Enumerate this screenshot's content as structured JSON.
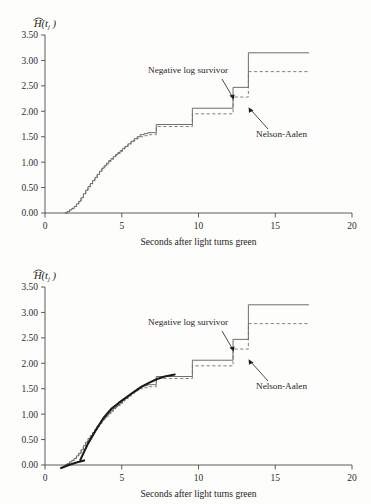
{
  "figure": {
    "panels": [
      {
        "id": "top",
        "name": "nelson-aalen-vs-negative-log-survivor"
      },
      {
        "id": "bottom",
        "name": "nelson-aalen-with-fitted-curve"
      }
    ]
  },
  "axes": {
    "y_label_main": "H",
    "y_label_arg": "(t",
    "y_label_sub": "j",
    "y_label_close": " )",
    "x_title": "Seconds after light turns green",
    "y_ticks": [
      "0.00",
      "0.50",
      "1.00",
      "1.50",
      "2.00",
      "2.50",
      "3.00",
      "3.50"
    ],
    "x_ticks": [
      "0",
      "5",
      "10",
      "15",
      "20"
    ],
    "ylim": [
      0,
      3.5
    ],
    "xlim": [
      0,
      20
    ],
    "grid": false
  },
  "annotations": {
    "negative_log_survivor": "Negative log survivor",
    "nelson_aalen": "Nelson-Aalen"
  },
  "colors": {
    "background": "#fdfdfb",
    "axis": "#4a4a4a",
    "solid_curve": "#555555",
    "dashed_curve": "#6b6b6b",
    "fitted_curve": "#1a1a1a",
    "text": "#1d1d1d"
  },
  "chart_data": {
    "type": "line",
    "title": "",
    "subtitle": "",
    "xlabel": "Seconds after light turns green",
    "ylabel": "H-hat(t_j)",
    "xlim": [
      0,
      20
    ],
    "ylim": [
      0,
      3.5
    ],
    "xticks": [
      0,
      5,
      10,
      15,
      20
    ],
    "yticks": [
      0,
      0.5,
      1.0,
      1.5,
      2.0,
      2.5,
      3.0,
      3.5
    ],
    "grid": false,
    "legend_position": "inline-annotations",
    "panels": [
      {
        "panel": "top",
        "series": [
          {
            "name": "Negative log survivor",
            "style": "solid",
            "step": true,
            "x": [
              1.3,
              1.45,
              1.6,
              1.75,
              1.9,
              2.05,
              2.2,
              2.35,
              2.5,
              2.65,
              2.8,
              2.95,
              3.1,
              3.25,
              3.4,
              3.55,
              3.7,
              3.85,
              4.0,
              4.15,
              4.3,
              4.45,
              4.6,
              4.75,
              4.9,
              5.05,
              5.2,
              5.4,
              5.6,
              5.8,
              6.0,
              6.2,
              6.45,
              6.7,
              7.25,
              9.6,
              12.25,
              13.25,
              17.2
            ],
            "y": [
              0.0,
              0.03,
              0.06,
              0.09,
              0.13,
              0.18,
              0.23,
              0.3,
              0.38,
              0.45,
              0.52,
              0.58,
              0.64,
              0.7,
              0.76,
              0.82,
              0.88,
              0.93,
              0.98,
              1.03,
              1.07,
              1.11,
              1.15,
              1.19,
              1.23,
              1.27,
              1.31,
              1.36,
              1.41,
              1.46,
              1.5,
              1.54,
              1.56,
              1.58,
              1.74,
              2.06,
              2.47,
              3.15,
              3.15
            ]
          },
          {
            "name": "Nelson-Aalen",
            "style": "dashed",
            "step": true,
            "x": [
              1.3,
              1.45,
              1.6,
              1.75,
              1.9,
              2.05,
              2.2,
              2.35,
              2.5,
              2.65,
              2.8,
              2.95,
              3.1,
              3.25,
              3.4,
              3.55,
              3.7,
              3.85,
              4.0,
              4.15,
              4.3,
              4.45,
              4.6,
              4.75,
              4.9,
              5.05,
              5.2,
              5.4,
              5.6,
              5.8,
              6.0,
              6.2,
              6.45,
              6.7,
              7.25,
              9.6,
              12.25,
              13.25,
              17.2
            ],
            "y": [
              0.0,
              0.03,
              0.06,
              0.09,
              0.13,
              0.18,
              0.23,
              0.3,
              0.37,
              0.44,
              0.51,
              0.57,
              0.63,
              0.69,
              0.75,
              0.8,
              0.86,
              0.91,
              0.96,
              1.01,
              1.05,
              1.09,
              1.13,
              1.17,
              1.21,
              1.25,
              1.29,
              1.34,
              1.39,
              1.43,
              1.47,
              1.5,
              1.52,
              1.54,
              1.7,
              1.95,
              2.28,
              2.78,
              2.78
            ]
          }
        ],
        "fitted_curves": []
      },
      {
        "panel": "bottom",
        "series": [
          {
            "name": "Negative log survivor",
            "style": "solid",
            "step": true,
            "x": [
              1.3,
              1.45,
              1.6,
              1.75,
              1.9,
              2.05,
              2.2,
              2.35,
              2.5,
              2.65,
              2.8,
              2.95,
              3.1,
              3.25,
              3.4,
              3.55,
              3.7,
              3.85,
              4.0,
              4.15,
              4.3,
              4.45,
              4.6,
              4.75,
              4.9,
              5.05,
              5.2,
              5.4,
              5.6,
              5.8,
              6.0,
              6.2,
              6.45,
              6.7,
              7.25,
              9.6,
              12.25,
              13.25,
              17.2
            ],
            "y": [
              0.0,
              0.03,
              0.06,
              0.09,
              0.13,
              0.18,
              0.23,
              0.3,
              0.38,
              0.45,
              0.52,
              0.58,
              0.64,
              0.7,
              0.76,
              0.82,
              0.88,
              0.93,
              0.98,
              1.03,
              1.07,
              1.11,
              1.15,
              1.19,
              1.23,
              1.27,
              1.31,
              1.36,
              1.41,
              1.46,
              1.5,
              1.54,
              1.56,
              1.58,
              1.74,
              2.06,
              2.47,
              3.15,
              3.15
            ]
          },
          {
            "name": "Nelson-Aalen",
            "style": "dashed",
            "step": true,
            "x": [
              1.3,
              1.45,
              1.6,
              1.75,
              1.9,
              2.05,
              2.2,
              2.35,
              2.5,
              2.65,
              2.8,
              2.95,
              3.1,
              3.25,
              3.4,
              3.55,
              3.7,
              3.85,
              4.0,
              4.15,
              4.3,
              4.45,
              4.6,
              4.75,
              4.9,
              5.05,
              5.2,
              5.4,
              5.6,
              5.8,
              6.0,
              6.2,
              6.45,
              6.7,
              7.25,
              9.6,
              12.25,
              13.25,
              17.2
            ],
            "y": [
              0.0,
              0.03,
              0.06,
              0.09,
              0.13,
              0.18,
              0.23,
              0.3,
              0.37,
              0.44,
              0.51,
              0.57,
              0.63,
              0.69,
              0.75,
              0.8,
              0.86,
              0.91,
              0.96,
              1.01,
              1.05,
              1.09,
              1.13,
              1.17,
              1.21,
              1.25,
              1.29,
              1.34,
              1.39,
              1.43,
              1.47,
              1.5,
              1.52,
              1.54,
              1.7,
              1.95,
              2.28,
              2.78,
              2.78
            ]
          }
        ],
        "fitted_curves": [
          {
            "name": "fitted-segment-low",
            "style": "thick-solid",
            "x": [
              1.05,
              1.55,
              2.05,
              2.55
            ],
            "y": [
              -0.06,
              0.0,
              0.05,
              0.09
            ]
          },
          {
            "name": "fitted-segment-main",
            "style": "thick-solid",
            "x": [
              2.3,
              2.8,
              3.3,
              3.8,
              4.3,
              4.8,
              5.3,
              5.8,
              6.3,
              6.8,
              7.3,
              7.8,
              8.45
            ],
            "y": [
              0.1,
              0.42,
              0.68,
              0.92,
              1.1,
              1.22,
              1.33,
              1.44,
              1.54,
              1.62,
              1.69,
              1.74,
              1.78
            ]
          }
        ]
      }
    ]
  }
}
